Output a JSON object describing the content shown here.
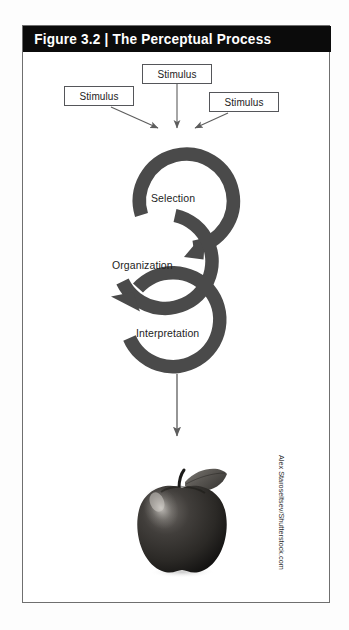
{
  "figure": {
    "number": "Figure 3.2",
    "separator": "|",
    "title": "The Perceptual Process",
    "header_full": "Figure 3.2  |  The Perceptual Process",
    "header_bg_color": "#0b0b0b",
    "header_text_color": "#ffffff",
    "frame_border_color": "#6f6f6f",
    "background_color": "#ffffff"
  },
  "inputs": {
    "boxes": [
      {
        "id": "top",
        "label": "Stimulus"
      },
      {
        "id": "left",
        "label": "Stimulus"
      },
      {
        "id": "right",
        "label": "Stimulus"
      }
    ]
  },
  "process": {
    "arrow_color": "#4a4a4a",
    "steps": [
      {
        "id": "selection",
        "label": "Selection"
      },
      {
        "id": "organization",
        "label": "Organization"
      },
      {
        "id": "interpretation",
        "label": "Interpretation"
      }
    ]
  },
  "output": {
    "image_alt": "apple",
    "apple_body_color": "#2f2d2b",
    "apple_leaf_color": "#5a5854"
  },
  "credit": {
    "text": "Alex Staroseltsev/Shutterstock.com"
  }
}
